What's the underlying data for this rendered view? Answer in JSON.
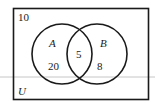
{
  "diagram": {
    "type": "venn",
    "universe_label": "U",
    "outside_value": "10",
    "sets": [
      {
        "name": "A",
        "only_value": "20"
      },
      {
        "name": "B",
        "only_value": "8"
      }
    ],
    "intersection_value": "5"
  },
  "colors": {
    "stroke": "#1a1a1a",
    "guide_line": "#b8b8b8",
    "background": "#ffffff"
  }
}
